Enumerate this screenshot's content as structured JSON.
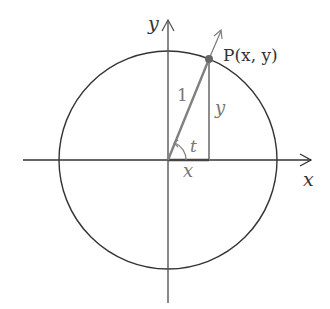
{
  "diagram": {
    "labels": {
      "y_axis": "y",
      "x_axis": "x",
      "point": "P(x, y)",
      "hypotenuse": "1",
      "opposite": "y",
      "adjacent": "x",
      "angle": "t"
    },
    "colors": {
      "axis": "#333333",
      "circle": "#333333",
      "triangle": "#808080",
      "point": "#666666",
      "label_grey": "#777777"
    },
    "geometry": {
      "center": [
        168,
        160
      ],
      "radius": 109,
      "point_P": [
        209,
        59
      ]
    }
  }
}
